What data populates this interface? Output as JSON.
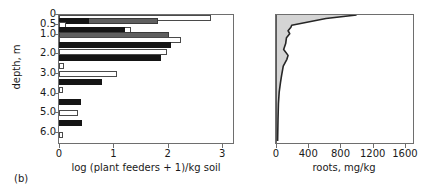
{
  "panel": {
    "label": "(b)"
  },
  "axes": {
    "y_title": "depth, m",
    "y_ticks": [
      "0",
      "0.5",
      "1.0",
      "2.0",
      "3.0",
      "4.0",
      "5.0",
      "6.0"
    ],
    "y_values": [
      0,
      0.5,
      1.0,
      2.0,
      3.0,
      4.0,
      5.0,
      6.0
    ],
    "left_x_title": "log (plant feeders + 1)/kg soil",
    "left_x_ticks": [
      "0",
      "1",
      "2",
      "3"
    ],
    "right_x_title": "roots, mg/kg",
    "right_x_ticks": [
      "0",
      "400",
      "800",
      "1200",
      "1600"
    ]
  },
  "colors": {
    "series_black": "#151515",
    "series_gray": "#5f5f5f",
    "series_white": "#ffffff",
    "axis": "#6e6e6e",
    "roots_fill": "#d4d4d4",
    "roots_line": "#262626"
  },
  "chart_data": [
    {
      "type": "bar",
      "title": "",
      "orientation": "horizontal",
      "xlabel": "log (plant feeders + 1)/kg soil",
      "ylabel": "depth, m",
      "xlim": [
        0,
        3.2
      ],
      "ylim": [
        0,
        6.5
      ],
      "grid": false,
      "legend": "none",
      "categories": [
        0.1,
        0.3,
        0.5,
        0.75,
        1.0,
        1.25,
        1.5,
        1.9,
        2.2,
        2.6,
        3.0,
        3.4,
        3.8,
        4.4,
        5.0,
        5.5,
        6.1
      ],
      "series": [
        {
          "name": "white",
          "color": "#ffffff",
          "values": [
            2.8,
            null,
            0.12,
            1.33,
            null,
            2.25,
            null,
            1.98,
            null,
            0.1,
            1.07,
            null,
            0.08,
            null,
            0.35,
            null,
            0.07
          ]
        },
        {
          "name": "gray",
          "color": "#5f5f5f",
          "values": [
            null,
            1.82,
            null,
            null,
            2.02,
            null,
            1.52,
            null,
            1.63,
            null,
            null,
            0.48,
            null,
            null,
            null,
            null,
            null
          ]
        },
        {
          "name": "black",
          "color": "#151515",
          "values": [
            null,
            0.56,
            null,
            1.21,
            null,
            null,
            2.06,
            null,
            1.88,
            null,
            null,
            0.79,
            null,
            0.41,
            null,
            0.42,
            null
          ]
        }
      ]
    },
    {
      "type": "area",
      "title": "",
      "xlabel": "roots, mg/kg",
      "ylabel": "depth, m",
      "xlim": [
        0,
        1700
      ],
      "ylim": [
        0,
        6.5
      ],
      "grid": false,
      "legend": "none",
      "x": [
        1000,
        620,
        195,
        185,
        150,
        170,
        130,
        120,
        95,
        150,
        135,
        90,
        70,
        55,
        40,
        30,
        25,
        20
      ],
      "y": [
        0.0,
        0.18,
        0.52,
        0.62,
        0.8,
        0.95,
        1.15,
        1.45,
        1.75,
        2.05,
        2.25,
        2.6,
        3.05,
        3.45,
        3.9,
        4.5,
        5.3,
        6.4
      ]
    }
  ]
}
